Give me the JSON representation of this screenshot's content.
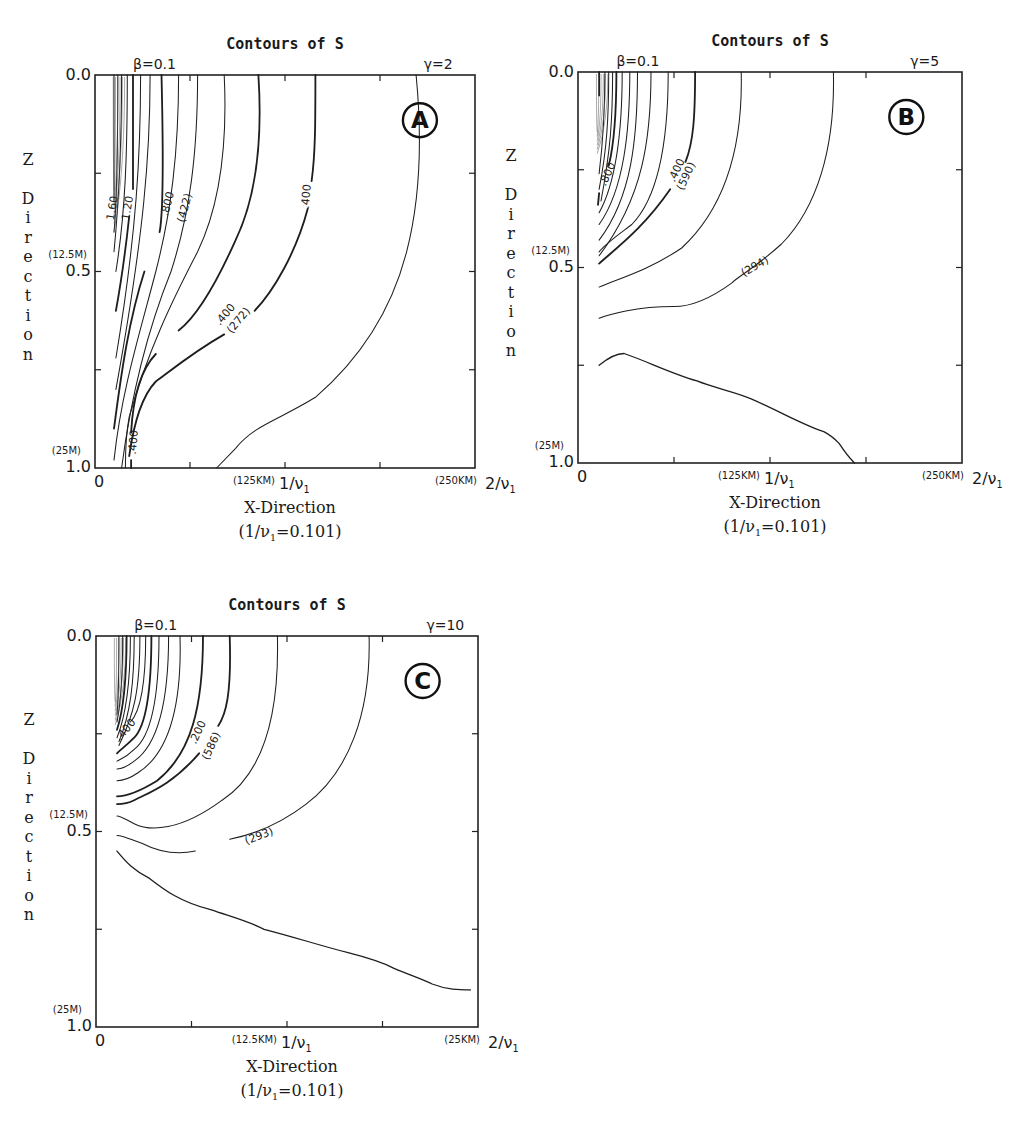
{
  "chart_data": [
    {
      "type": "contour",
      "panel_label": "A",
      "title": "Contours of S",
      "beta_label": "β=0.1",
      "gamma_label": "γ=2",
      "xlabel": "X-Direction",
      "xlabel_sub": "(1/ν₁=0.101)",
      "ylabel": "Z Direction",
      "x_ticks": [
        {
          "label": "0",
          "value": 0
        },
        {
          "label": "1/ν₁",
          "value": 1,
          "note": "(125KM)"
        },
        {
          "label": "2/ν₁",
          "value": 2,
          "note": "(250KM)"
        }
      ],
      "y_ticks": [
        {
          "label": "0.0",
          "value": 0.0
        },
        {
          "label": "0.5",
          "value": 0.5,
          "note": "(12.5M)"
        },
        {
          "label": "1.0",
          "value": 1.0,
          "note": "(25M)"
        }
      ],
      "xlim": [
        0,
        2
      ],
      "ylim": [
        1.0,
        0.0
      ],
      "contour_labels": [
        "1.60",
        "1.20",
        ".800",
        "(422)",
        ".400",
        "(272)",
        ".400",
        ".400"
      ],
      "contours": [
        {
          "d": "M0.05,0 C0.05,0.15 0.05,0.25 0.05,0.32",
          "w": 0.8
        },
        {
          "d": "M0.06,0 C0.06,0.15 0.06,0.3 0.05,0.40",
          "w": 0.8
        },
        {
          "d": "M0.07,0 C0.07,0.2 0.06,0.35 0.05,0.45",
          "w": 0.8
        },
        {
          "d": "M0.085,0 C0.085,0.2 0.08,0.35 0.055,0.50",
          "w": 0.8
        },
        {
          "d": "M0.10,0 C0.10,0.2 0.10,0.25 0.10,0.29 M0.09,0.36 C0.08,0.45 0.07,0.52 0.055,0.60",
          "w": 1.4
        },
        {
          "d": "M0.12,0 C0.12,0.2 0.11,0.4 0.055,0.72",
          "w": 0.8
        },
        {
          "d": "M0.145,0 C0.145,0.2 0.13,0.4 0.055,0.80",
          "w": 0.8
        },
        {
          "d": "M0.175,0 C0.18,0.2 0.18,0.35 0.17,0.40 M0.13,0.50 C0.09,0.62 0.07,0.75 0.05,0.90",
          "w": 1.4
        },
        {
          "d": "M0.22,0 C0.22,0.2 0.20,0.35 0.16,0.50 C0.12,0.65 0.07,0.80 0.05,0.98",
          "w": 0.8
        },
        {
          "d": "M0.27,0 C0.27,0.2 0.25,0.35 0.20,0.50 C0.15,0.62 0.10,0.78 0.07,1.0",
          "w": 0.8
        },
        {
          "d": "M0.34,0 C0.35,0.2 0.32,0.35 0.27,0.45 C0.20,0.58 0.14,0.70 0.09,0.87 C0.08,0.92 0.08,0.96 0.08,1.0",
          "w": 0.8
        },
        {
          "d": "M0.43,0 C0.44,0.15 0.43,0.3 0.37,0.42 C0.31,0.55 0.26,0.62 0.22,0.65 M0.16,0.71 C0.12,0.75 0.10,0.82 0.095,0.91 M0.095,0.98 L0.095,1.0",
          "w": 1.4
        },
        {
          "d": "M0.58,0 C0.58,0.12 0.58,0.2 0.57,0.27 M0.56,0.34 C0.53,0.45 0.47,0.55 0.42,0.60 M0.34,0.66 C0.25,0.71 0.19,0.76 0.16,0.78 C0.12,0.82 0.10,0.90 0.09,0.97",
          "w": 1.4
        },
        {
          "d": "M0.845,0 C0.86,0.15 0.86,0.30 0.82,0.45 C0.78,0.60 0.70,0.72 0.58,0.82 C0.48,0.88 0.42,0.89 0.37,0.95 C0.35,0.97 0.33,0.99 0.32,1.0",
          "w": 0.8
        }
      ],
      "label_positions": [
        {
          "text": "1.60",
          "x": 0.055,
          "z": 0.34,
          "rot": -80
        },
        {
          "text": "1.20",
          "x": 0.095,
          "z": 0.34,
          "rot": -80
        },
        {
          "text": ".800",
          "x": 0.2,
          "z": 0.33,
          "rot": -75
        },
        {
          "text": "(422)",
          "x": 0.245,
          "z": 0.34,
          "rot": -75
        },
        {
          "text": ".400",
          "x": 0.565,
          "z": 0.31,
          "rot": -85
        },
        {
          "text": ".400",
          "x": 0.35,
          "z": 0.615,
          "rot": -50
        },
        {
          "text": "(272)",
          "x": 0.385,
          "z": 0.63,
          "rot": -50
        },
        {
          "text": ".400",
          "x": 0.11,
          "z": 0.935,
          "rot": -85
        }
      ]
    },
    {
      "type": "contour",
      "panel_label": "B",
      "title": "Contours of S",
      "beta_label": "β=0.1",
      "gamma_label": "γ=5",
      "xlabel": "X-Direction",
      "xlabel_sub": "(1/ν₁=0.101)",
      "ylabel": "Z Direction",
      "x_ticks": [
        {
          "label": "0",
          "value": 0
        },
        {
          "label": "1/ν₁",
          "value": 1,
          "note": "(125KM)"
        },
        {
          "label": "2/ν₁",
          "value": 2,
          "note": "(250KM)"
        }
      ],
      "y_ticks": [
        {
          "label": "0.0",
          "value": 0.0
        },
        {
          "label": "0.5",
          "value": 0.5,
          "note": "(12.5M)"
        },
        {
          "label": "1.0",
          "value": 1.0,
          "note": "(25M)"
        }
      ],
      "xlim": [
        0,
        2
      ],
      "ylim": [
        1.0,
        0.0
      ],
      "contour_labels": [
        ".800",
        ".400",
        "(590)",
        "(294)"
      ],
      "contours": [
        {
          "d": "M0.055,0 L0.055,0.06",
          "w": 1.4
        },
        {
          "d": "M0.07,0 C0.07,0.1 0.065,0.18 0.055,0.26",
          "w": 0.8
        },
        {
          "d": "M0.08,0 C0.08,0.12 0.075,0.2 0.055,0.30",
          "w": 0.8
        },
        {
          "d": "M0.09,0 C0.09,0.12 0.085,0.2 0.06,0.33",
          "w": 0.8
        },
        {
          "d": "M0.10,0 C0.10,0.14 0.09,0.2 0.08,0.24 M0.055,0.31 L0.052,0.34",
          "w": 1.4
        },
        {
          "d": "M0.115,0 C0.115,0.15 0.10,0.28 0.055,0.36",
          "w": 0.8
        },
        {
          "d": "M0.135,0 C0.135,0.15 0.12,0.3 0.055,0.39",
          "w": 0.8
        },
        {
          "d": "M0.155,0 C0.155,0.17 0.14,0.32 0.055,0.43",
          "w": 0.8
        },
        {
          "d": "M0.19,0 C0.19,0.17 0.17,0.32 0.055,0.47",
          "w": 0.8
        },
        {
          "d": "M0.235,0 C0.235,0.18 0.21,0.32 0.14,0.39 C0.10,0.42 0.07,0.44 0.055,0.46",
          "w": 0.8
        },
        {
          "d": "M0.305,0 C0.305,0.12 0.30,0.18 0.28,0.23 M0.24,0.30 C0.17,0.40 0.10,0.45 0.055,0.49",
          "w": 1.4
        },
        {
          "d": "M0.425,0 C0.43,0.2 0.38,0.35 0.27,0.45 C0.18,0.51 0.10,0.53 0.055,0.55",
          "w": 0.8
        },
        {
          "d": "M0.665,0 C0.67,0.2 0.62,0.35 0.53,0.44 C0.45,0.51 0.42,0.52 0.40,0.54 C0.33,0.59 0.28,0.60 0.25,0.60 C0.15,0.60 0.08,0.62 0.055,0.63",
          "w": 0.8
        },
        {
          "d": "M0.055,0.75 C0.08,0.73 0.10,0.72 0.12,0.72 C0.18,0.74 0.24,0.77 0.31,0.79 C0.36,0.81 0.42,0.82 0.46,0.84 C0.53,0.87 0.58,0.90 0.64,0.92 C0.66,0.93 0.67,0.94 0.68,0.95 C0.70,0.98 0.71,0.99 0.72,1.0",
          "w": 1.0
        }
      ],
      "label_positions": [
        {
          "text": ".800",
          "x": 0.085,
          "z": 0.265,
          "rot": -65
        },
        {
          "text": ".400",
          "x": 0.265,
          "z": 0.255,
          "rot": -65
        },
        {
          "text": "(590)",
          "x": 0.29,
          "z": 0.27,
          "rot": -65
        },
        {
          "text": "(294)",
          "x": 0.465,
          "z": 0.505,
          "rot": -30
        }
      ]
    },
    {
      "type": "contour",
      "panel_label": "C",
      "title": "Contours of S",
      "beta_label": "β=0.1",
      "gamma_label": "γ=10",
      "xlabel": "X-Direction",
      "xlabel_sub": "(1/ν₁=0.101)",
      "ylabel": "Z Direction",
      "x_ticks": [
        {
          "label": "0",
          "value": 0
        },
        {
          "label": "1/ν₁",
          "value": 1,
          "note": "(12.5KM)"
        },
        {
          "label": "2/ν₁",
          "value": 2,
          "note": "(25KM)"
        }
      ],
      "y_ticks": [
        {
          "label": "0.0",
          "value": 0.0
        },
        {
          "label": "0.5",
          "value": 0.5,
          "note": "(12.5M)"
        },
        {
          "label": "1.0",
          "value": 1.0,
          "note": "(25M)"
        }
      ],
      "xlim": [
        0,
        2
      ],
      "ylim": [
        1.0,
        0.0
      ],
      "contour_labels": [
        ".400",
        ".200",
        "(586)",
        "(293)"
      ],
      "contours": [
        {
          "d": "M0.06,0 C0.06,0.1 0.06,0.15 0.055,0.20",
          "w": 0.8
        },
        {
          "d": "M0.07,0 C0.07,0.1 0.065,0.17 0.055,0.22",
          "w": 0.8
        },
        {
          "d": "M0.08,0 C0.08,0.1 0.075,0.18 0.055,0.24",
          "w": 1.4
        },
        {
          "d": "M0.09,0 C0.09,0.12 0.08,0.2 0.055,0.26",
          "w": 0.8
        },
        {
          "d": "M0.10,0 C0.10,0.12 0.09,0.2 0.06,0.27",
          "w": 0.8
        },
        {
          "d": "M0.115,0 C0.115,0.14 0.10,0.2 0.06,0.28",
          "w": 0.8
        },
        {
          "d": "M0.13,0 C0.13,0.14 0.11,0.2 0.09,0.22",
          "w": 0.8
        },
        {
          "d": "M0.145,0 C0.145,0.15 0.13,0.23 0.10,0.26 C0.08,0.28 0.065,0.29 0.055,0.30",
          "w": 1.4
        },
        {
          "d": "M0.165,0 C0.165,0.17 0.14,0.26 0.10,0.29 C0.08,0.31 0.065,0.315 0.055,0.32",
          "w": 0.8
        },
        {
          "d": "M0.19,0 C0.19,0.17 0.16,0.28 0.10,0.32 C0.08,0.335 0.065,0.34 0.055,0.34",
          "w": 0.8
        },
        {
          "d": "M0.22,0 C0.225,0.18 0.19,0.3 0.11,0.35 C0.08,0.37 0.065,0.37 0.055,0.37",
          "w": 0.8
        },
        {
          "d": "M0.28,0 C0.28,0.18 0.25,0.3 0.16,0.37 C0.11,0.40 0.08,0.41 0.055,0.41",
          "w": 1.4
        },
        {
          "d": "M0.35,0 C0.355,0.15 0.34,0.2 0.32,0.23 M0.27,0.30 C0.20,0.38 0.14,0.40 0.10,0.42 C0.08,0.43 0.065,0.43 0.055,0.43",
          "w": 1.4
        },
        {
          "d": "M0.475,0 C0.48,0.2 0.44,0.35 0.33,0.42 C0.22,0.50 0.14,0.50 0.10,0.48 C0.08,0.47 0.065,0.46 0.055,0.46",
          "w": 0.8
        },
        {
          "d": "M0.715,0 C0.72,0.2 0.66,0.35 0.55,0.43 C0.47,0.49 0.40,0.51 0.35,0.52 M0.26,0.55 C0.21,0.56 0.16,0.55 0.12,0.53 C0.09,0.52 0.07,0.51 0.055,0.51",
          "w": 0.8
        },
        {
          "d": "M0.055,0.55 C0.08,0.58 0.10,0.60 0.14,0.62 C0.18,0.65 0.22,0.68 0.30,0.70 C0.36,0.72 0.40,0.73 0.44,0.75 C0.52,0.77 0.58,0.79 0.66,0.81 C0.70,0.82 0.74,0.83 0.78,0.85 C0.83,0.87 0.86,0.88 0.88,0.89 C0.92,0.905 0.95,0.905 0.98,0.905",
          "w": 1.0
        }
      ],
      "label_positions": [
        {
          "text": ".400",
          "x": 0.085,
          "z": 0.245,
          "rot": -50
        },
        {
          "text": ".200",
          "x": 0.275,
          "z": 0.25,
          "rot": -65
        },
        {
          "text": "(586)",
          "x": 0.31,
          "z": 0.285,
          "rot": -65
        },
        {
          "text": "(293)",
          "x": 0.43,
          "z": 0.52,
          "rot": -20
        }
      ]
    }
  ],
  "panels": [
    {
      "title": "Contours of S",
      "beta": "β=0.1",
      "gamma": "γ=2",
      "badge": "A",
      "y_top": "0.0",
      "y_mid": "0.5",
      "y_bot": "1.0",
      "y_mid_note": "(12.5M)",
      "y_bot_note": "(25M)",
      "x_zero": "0",
      "x_one": "1/ν",
      "x_two": "2/ν",
      "sub": "1",
      "x_one_note": "(125KM)",
      "x_two_note": "(250KM)",
      "xlabel": "X-Direction",
      "xlabel_sub_pre": "(1/ν",
      "xlabel_sub_post": "=0.101)",
      "zlabel": [
        "Z",
        "",
        "D",
        "i",
        "r",
        "e",
        "c",
        "t",
        "i",
        "o",
        "n"
      ]
    },
    {
      "title": "Contours of S",
      "beta": "β=0.1",
      "gamma": "γ=5",
      "badge": "B",
      "y_top": "0.0",
      "y_mid": "0.5",
      "y_bot": "1.0",
      "y_mid_note": "(12.5M)",
      "y_bot_note": "(25M)",
      "x_zero": "0",
      "x_one": "1/ν",
      "x_two": "2/ν",
      "sub": "1",
      "x_one_note": "(125KM)",
      "x_two_note": "(250KM)",
      "xlabel": "X-Direction",
      "xlabel_sub_pre": "(1/ν",
      "xlabel_sub_post": "=0.101)",
      "zlabel": [
        "Z",
        "",
        "D",
        "i",
        "r",
        "e",
        "c",
        "t",
        "i",
        "o",
        "n"
      ]
    },
    {
      "title": "Contours of S",
      "beta": "β=0.1",
      "gamma": "γ=10",
      "badge": "C",
      "y_top": "0.0",
      "y_mid": "0.5",
      "y_bot": "1.0",
      "y_mid_note": "(12.5M)",
      "y_bot_note": "(25M)",
      "x_zero": "0",
      "x_one": "1/ν",
      "x_two": "2/ν",
      "sub": "1",
      "x_one_note": "(12.5KM)",
      "x_two_note": "(25KM)",
      "xlabel": "X-Direction",
      "xlabel_sub_pre": "(1/ν",
      "xlabel_sub_post": "=0.101)",
      "zlabel": [
        "Z",
        "",
        "D",
        "i",
        "r",
        "e",
        "c",
        "t",
        "i",
        "o",
        "n"
      ]
    }
  ]
}
